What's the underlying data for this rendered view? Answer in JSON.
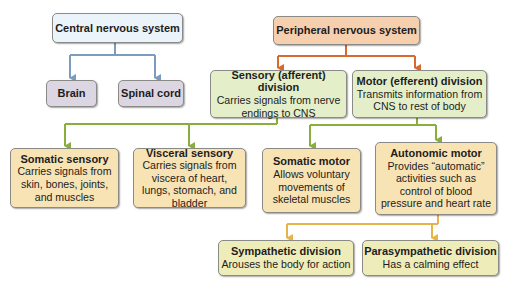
{
  "diagram": {
    "colors": {
      "cns_connector": "#7a9cbf",
      "pns_connector": "#d9692d",
      "division_connector": "#8aae3c",
      "autonomic_connector": "#e6b54a"
    },
    "cns": {
      "title": "Central nervous system",
      "children": [
        {
          "title": "Brain"
        },
        {
          "title": "Spinal cord"
        }
      ]
    },
    "pns": {
      "title": "Peripheral nervous system",
      "sensory": {
        "title": "Sensory (afferent) division",
        "desc": "Carries signals from nerve endings to CNS",
        "children": [
          {
            "title": "Somatic sensory",
            "desc": "Carries signals from skin, bones, joints, and muscles"
          },
          {
            "title": "Visceral sensory",
            "desc": "Carries signals from viscera of heart, lungs, stomach, and bladder"
          }
        ]
      },
      "motor": {
        "title": "Motor (efferent) division",
        "desc": "Transmits information from CNS to rest of body",
        "children": [
          {
            "title": "Somatic motor",
            "desc": "Allows voluntary movements of skeletal muscles"
          },
          {
            "title": "Autonomic motor",
            "desc": "Provides “automatic” activities such as control of blood pressure and heart rate"
          }
        ]
      },
      "autonomic_children": [
        {
          "title": "Sympathetic division",
          "desc": "Arouses the body for action"
        },
        {
          "title": "Parasympathetic division",
          "desc": "Has a calming effect"
        }
      ]
    }
  }
}
